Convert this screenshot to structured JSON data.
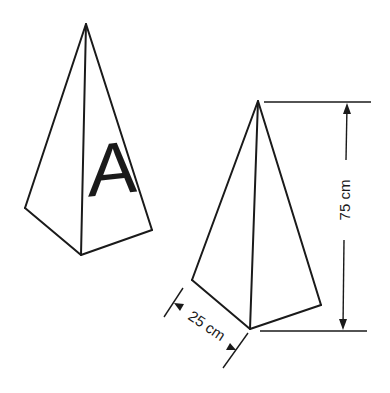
{
  "figure": {
    "pyramid_a": {
      "face_letter": "A"
    },
    "pyramid_b": {
      "height_label": "75 cm",
      "base_label": "25 cm"
    }
  },
  "colors": {
    "ink": "#1a1a1a",
    "background": "#ffffff"
  }
}
